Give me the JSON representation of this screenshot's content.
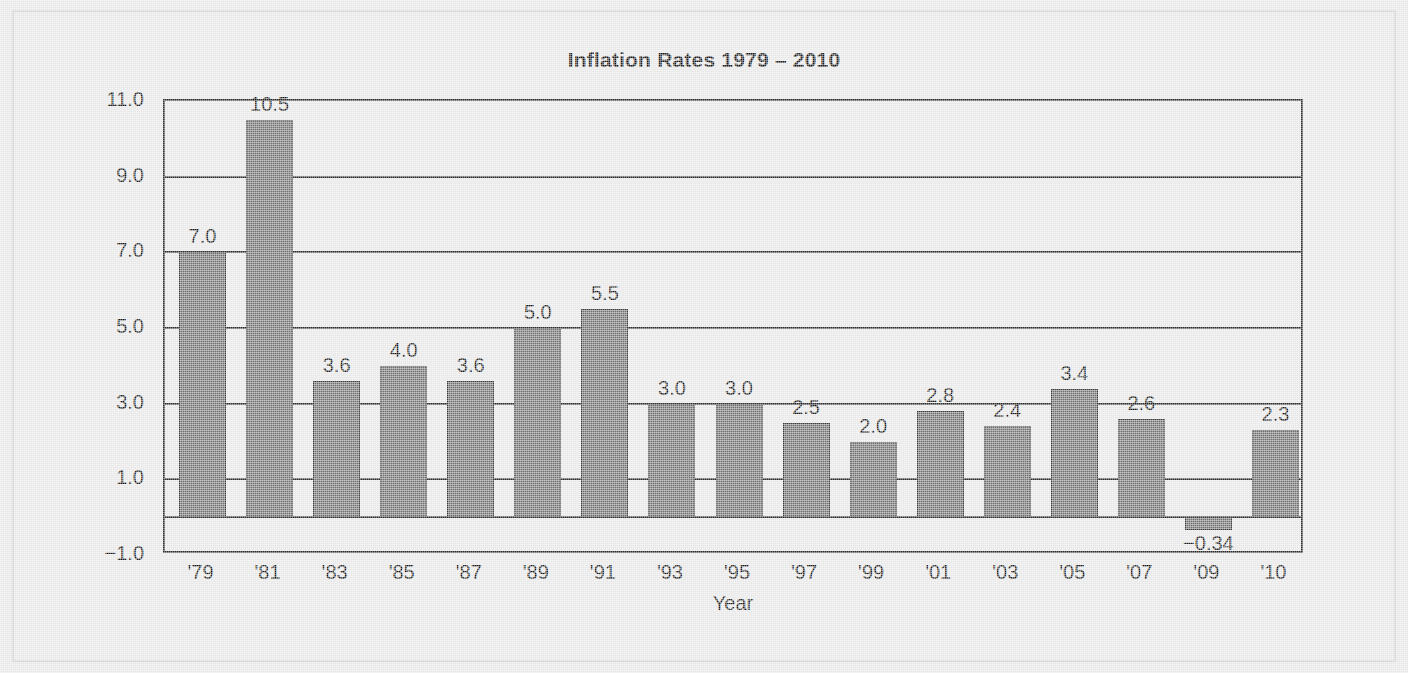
{
  "chart_data": {
    "type": "bar",
    "title": "Inflation Rates 1979 – 2010",
    "xlabel": "Year",
    "ylabel": "",
    "categories": [
      "'79",
      "'81",
      "'83",
      "'85",
      "'87",
      "'89",
      "'91",
      "'93",
      "'95",
      "'97",
      "'99",
      "'01",
      "'03",
      "'05",
      "'07",
      "'09",
      "'10"
    ],
    "values": [
      7.0,
      10.5,
      3.6,
      4.0,
      3.6,
      5.0,
      5.5,
      3.0,
      3.0,
      2.5,
      2.0,
      2.8,
      2.4,
      3.4,
      2.6,
      -0.34,
      2.3
    ],
    "data_labels": [
      "7.0",
      "10.5",
      "3.6",
      "4.0",
      "3.6",
      "5.0",
      "5.5",
      "3.0",
      "3.0",
      "2.5",
      "2.0",
      "2.8",
      "2.4",
      "3.4",
      "2.6",
      "−0.34",
      "2.3"
    ],
    "ylim": [
      -1.0,
      11.0
    ],
    "yticks": [
      11.0,
      9.0,
      7.0,
      5.0,
      3.0,
      1.0,
      -1.0
    ],
    "ytick_labels": [
      "11.0",
      "9.0",
      "7.0",
      "5.0",
      "3.0",
      "1.0",
      "−1.0"
    ],
    "grid": true,
    "legend": "none",
    "bar_color": "#6f6f6f",
    "bar_edge_color": "#3a3a3a",
    "axis_color": "#2b2b2b",
    "background_color": "#e6e6e6",
    "text_color": "#1a1a1a"
  }
}
